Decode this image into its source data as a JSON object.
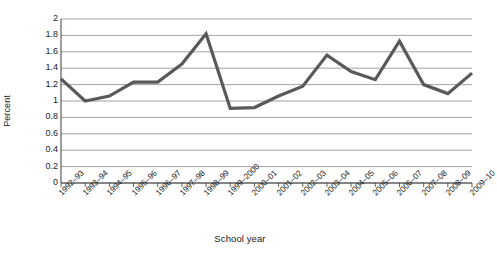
{
  "chart_data": {
    "type": "line",
    "title": "",
    "xlabel": "School year",
    "ylabel": "Percent",
    "ylim": [
      0,
      2
    ],
    "ytick_step": 0.2,
    "grid": true,
    "legend": false,
    "line_color": "#595959",
    "categories": [
      "1992–93",
      "1993–94",
      "1994–95",
      "1995–96",
      "1996–97",
      "1997–98",
      "1998–99",
      "1999–2000",
      "2000–01",
      "2001–02",
      "2002–03",
      "2003–04",
      "2004–05",
      "2005–06",
      "2006–07",
      "2007–08",
      "2008–09",
      "2009–10"
    ],
    "values": [
      1.27,
      1.0,
      1.06,
      1.23,
      1.23,
      1.45,
      1.82,
      0.91,
      0.92,
      1.06,
      1.18,
      1.56,
      1.36,
      1.26,
      1.73,
      1.2,
      1.09,
      1.34
    ],
    "ytick_labels": [
      "0",
      "0.2",
      "0.4",
      "0.6",
      "0.8",
      "1",
      "1.2",
      "1.4",
      "1.6",
      "1.8",
      "2"
    ],
    "ytick_values": [
      0,
      0.2,
      0.4,
      0.6,
      0.8,
      1,
      1.2,
      1.4,
      1.6,
      1.8,
      2
    ]
  }
}
